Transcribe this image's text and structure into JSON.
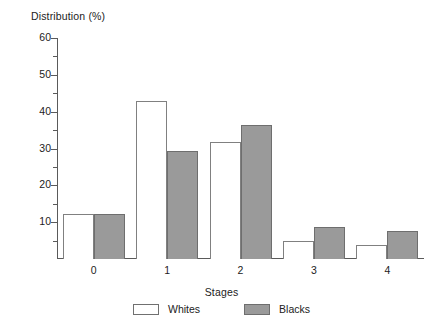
{
  "chart_data": {
    "type": "bar",
    "title": "",
    "subtitle": "",
    "xlabel": "Stages",
    "ylabel": "Distribution (%)",
    "categories": [
      "0",
      "1",
      "2",
      "3",
      "4"
    ],
    "series": [
      {
        "name": "Whites",
        "color": "#ffffff",
        "values": [
          12.2,
          42.8,
          31.9,
          4.9,
          3.8
        ]
      },
      {
        "name": "Blacks",
        "color": "#9a9a9a",
        "values": [
          12.2,
          29.3,
          36.5,
          8.6,
          7.5
        ]
      }
    ],
    "ylim": [
      0,
      60
    ],
    "y_major_ticks": [
      0,
      10,
      20,
      30,
      40,
      50,
      60
    ],
    "y_tick_labels": [
      "",
      "10",
      "20",
      "30",
      "40",
      "50",
      "60"
    ],
    "y_minor_tick_interval": 5,
    "grid": false,
    "legend_position": "bottom",
    "legend_entries": [
      "Whites",
      "Blacks"
    ]
  },
  "axes": {
    "y_title": "Distribution (%)",
    "x_title": "Stages"
  },
  "legend": {
    "items": [
      {
        "label": "Whites",
        "swatch": "white-outlined-box"
      },
      {
        "label": "Blacks",
        "swatch": "gray-filled-box"
      }
    ]
  }
}
